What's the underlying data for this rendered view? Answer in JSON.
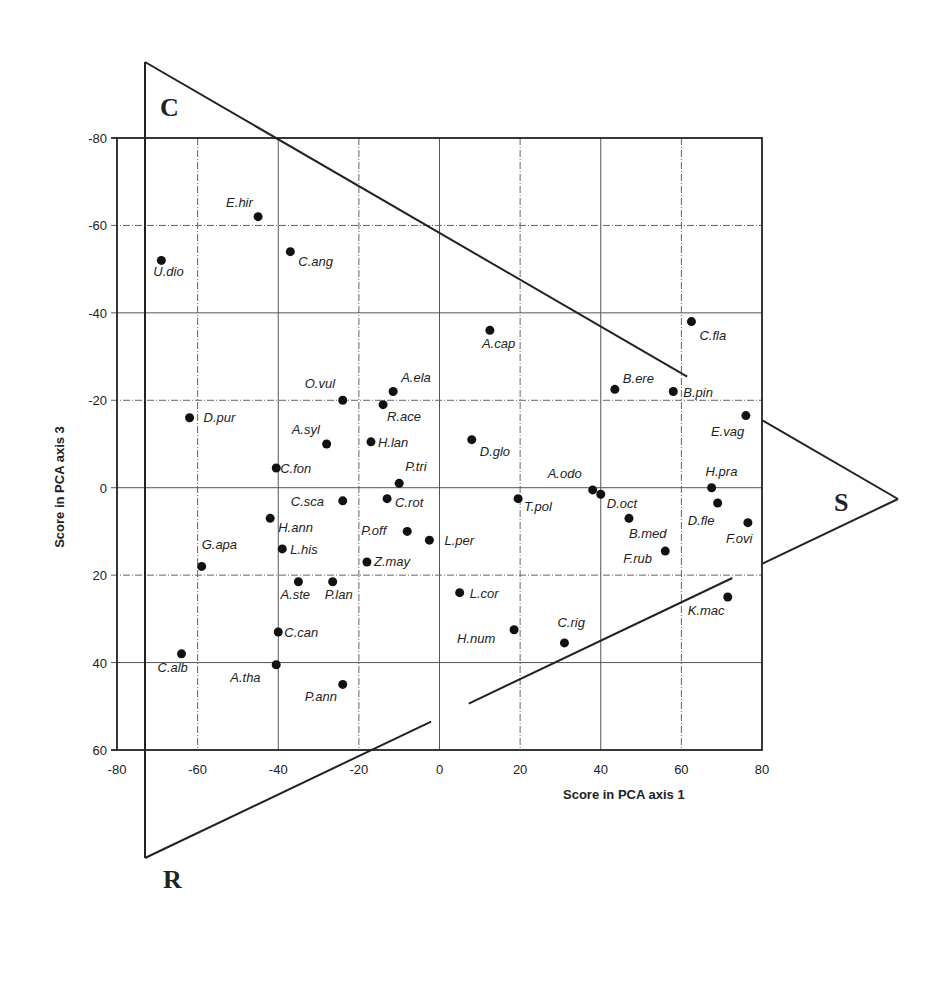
{
  "chart_data": {
    "type": "scatter",
    "title": "",
    "xlabel": "Score in PCA axis 1",
    "ylabel": "Score in PCA axis 3",
    "xlim": [
      -80,
      80
    ],
    "ylim": [
      -80,
      60
    ],
    "y_inverted": true,
    "x_ticks": [
      -80,
      -60,
      -40,
      -20,
      0,
      20,
      40,
      60,
      80
    ],
    "y_ticks": [
      -80,
      -60,
      -40,
      -20,
      0,
      20,
      40,
      60
    ],
    "grid": true,
    "legend": null,
    "overlay": {
      "shape": "triangle",
      "vertex_labels": [
        "C",
        "S",
        "R"
      ]
    },
    "points": [
      {
        "label": "U.dio",
        "x": -69,
        "y": -52
      },
      {
        "label": "E.hir",
        "x": -45,
        "y": -62
      },
      {
        "label": "C.ang",
        "x": -37,
        "y": -54
      },
      {
        "label": "A.cap",
        "x": 12.5,
        "y": -36
      },
      {
        "label": "C.fla",
        "x": 62.5,
        "y": -38
      },
      {
        "label": "O.vul",
        "x": -24,
        "y": -20
      },
      {
        "label": "A.ela",
        "x": -11.5,
        "y": -22
      },
      {
        "label": "R.ace",
        "x": -14,
        "y": -19
      },
      {
        "label": "B.ere",
        "x": 43.5,
        "y": -22.5
      },
      {
        "label": "B.pin",
        "x": 58,
        "y": -22
      },
      {
        "label": "D.pur",
        "x": -62,
        "y": -16
      },
      {
        "label": "E.vag",
        "x": 76,
        "y": -16.5
      },
      {
        "label": "A.syl",
        "x": -28,
        "y": -10
      },
      {
        "label": "H.lan",
        "x": -17,
        "y": -10.5
      },
      {
        "label": "D.glo",
        "x": 8,
        "y": -11
      },
      {
        "label": "C.fon",
        "x": -40.5,
        "y": -4.5
      },
      {
        "label": "P.tri",
        "x": -10,
        "y": -1
      },
      {
        "label": "A.odo",
        "x": 38,
        "y": 0.5
      },
      {
        "label": "D.oct",
        "x": 40,
        "y": 1.5
      },
      {
        "label": "H.pra",
        "x": 67.5,
        "y": 0
      },
      {
        "label": "C.sca",
        "x": -24,
        "y": 3
      },
      {
        "label": "C.rot",
        "x": -13,
        "y": 2.5
      },
      {
        "label": "T.pol",
        "x": 19.5,
        "y": 2.5
      },
      {
        "label": "D.fle",
        "x": 69,
        "y": 3.5
      },
      {
        "label": "H.ann",
        "x": -42,
        "y": 7
      },
      {
        "label": "P.off",
        "x": -8,
        "y": 10
      },
      {
        "label": "B.med",
        "x": 47,
        "y": 7
      },
      {
        "label": "F.ovi",
        "x": 76.5,
        "y": 8
      },
      {
        "label": "L.per",
        "x": -2.5,
        "y": 12
      },
      {
        "label": "L.his",
        "x": -39,
        "y": 14
      },
      {
        "label": "F.rub",
        "x": 56,
        "y": 14.5
      },
      {
        "label": "G.apa",
        "x": -59,
        "y": 18
      },
      {
        "label": "Z.may",
        "x": -18,
        "y": 17
      },
      {
        "label": "A.ste",
        "x": -35,
        "y": 21.5
      },
      {
        "label": "P.lan",
        "x": -26.5,
        "y": 21.5
      },
      {
        "label": "L.cor",
        "x": 5,
        "y": 24
      },
      {
        "label": "K.mac",
        "x": 71.5,
        "y": 25
      },
      {
        "label": "C.can",
        "x": -40,
        "y": 33
      },
      {
        "label": "H.num",
        "x": 18.5,
        "y": 32.5
      },
      {
        "label": "C.rig",
        "x": 31,
        "y": 35.5
      },
      {
        "label": "C.alb",
        "x": -64,
        "y": 38
      },
      {
        "label": "A.tha",
        "x": -40.5,
        "y": 40.5
      },
      {
        "label": "P.ann",
        "x": -24,
        "y": 45
      }
    ]
  },
  "layout_hints": {
    "label_offsets": {
      "U.dio": [
        -8,
        16
      ],
      "E.hir": [
        -32,
        -10
      ],
      "C.ang": [
        8,
        14
      ],
      "A.cap": [
        -8,
        18
      ],
      "C.fla": [
        8,
        18
      ],
      "O.vul": [
        -38,
        -12
      ],
      "A.ela": [
        8,
        -10
      ],
      "R.ace": [
        4,
        16
      ],
      "B.ere": [
        8,
        -6
      ],
      "B.pin": [
        10,
        5
      ],
      "D.pur": [
        14,
        4
      ],
      "E.vag": [
        -35,
        20
      ],
      "A.syl": [
        -35,
        -10
      ],
      "H.lan": [
        7,
        5
      ],
      "D.glo": [
        8,
        16
      ],
      "C.fon": [
        4,
        5
      ],
      "P.tri": [
        6,
        -12
      ],
      "A.odo": [
        -45,
        -12
      ],
      "D.oct": [
        6,
        14
      ],
      "H.pra": [
        -6,
        -12
      ],
      "C.sca": [
        -52,
        5
      ],
      "C.rot": [
        8,
        8
      ],
      "T.pol": [
        6,
        12
      ],
      "D.fle": [
        -30,
        22
      ],
      "H.ann": [
        8,
        14
      ],
      "P.off": [
        -46,
        4
      ],
      "B.med": [
        0,
        20
      ],
      "F.ovi": [
        -22,
        20
      ],
      "L.per": [
        15,
        5
      ],
      "L.his": [
        8,
        5
      ],
      "F.rub": [
        -42,
        12
      ],
      "G.apa": [
        0,
        -17
      ],
      "Z.may": [
        7,
        4
      ],
      "A.ste": [
        -18,
        17
      ],
      "P.lan": [
        -8,
        17
      ],
      "L.cor": [
        10,
        5
      ],
      "K.mac": [
        -40,
        18
      ],
      "C.can": [
        6,
        5
      ],
      "H.num": [
        -57,
        13
      ],
      "C.rig": [
        -7,
        -16
      ],
      "C.alb": [
        -24,
        18
      ],
      "A.tha": [
        -46,
        17
      ],
      "P.ann": [
        -38,
        17
      ]
    }
  }
}
